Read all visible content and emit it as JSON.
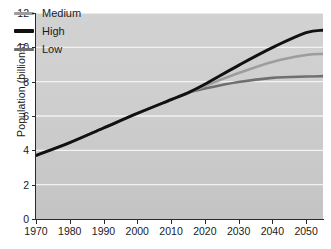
{
  "chart_data": {
    "type": "line",
    "title": "",
    "xlabel": "",
    "ylabel": "Population (billions)",
    "xlim": [
      1970,
      2055
    ],
    "ylim": [
      0,
      12
    ],
    "xticks": [
      1970,
      1980,
      1990,
      2000,
      2010,
      2020,
      2030,
      2040,
      2050
    ],
    "yticks": [
      0,
      2,
      4,
      6,
      8,
      10,
      12
    ],
    "grid": "horizontal-white",
    "legend_position": "top-left-inside",
    "x": [
      1970,
      1980,
      1990,
      2000,
      2010,
      2015,
      2020,
      2030,
      2040,
      2050,
      2055
    ],
    "series": [
      {
        "name": "Medium",
        "color": "#9d9d9d",
        "values": [
          3.7,
          4.45,
          5.3,
          6.15,
          6.95,
          7.35,
          7.75,
          8.5,
          9.15,
          9.55,
          9.62
        ]
      },
      {
        "name": "High",
        "color": "#111111",
        "values": [
          3.7,
          4.45,
          5.3,
          6.15,
          6.95,
          7.35,
          7.85,
          8.95,
          9.98,
          10.85,
          11.0
        ]
      },
      {
        "name": "Low",
        "color": "#6f6f6f",
        "values": [
          3.7,
          4.45,
          5.3,
          6.15,
          6.95,
          7.35,
          7.6,
          7.98,
          8.22,
          8.3,
          8.32
        ]
      }
    ]
  },
  "legend": {
    "items": [
      {
        "label": "Medium",
        "color": "#9d9d9d",
        "weight": "thin"
      },
      {
        "label": "High",
        "color": "#111111",
        "weight": "thick"
      },
      {
        "label": "Low",
        "color": "#6f6f6f",
        "weight": "thin"
      }
    ]
  },
  "axes": {
    "y_title": "Population (billions)",
    "y_tick_labels": [
      "12",
      "10",
      "8",
      "6",
      "4",
      "2",
      "0"
    ],
    "x_tick_labels": [
      "1970",
      "1980",
      "1990",
      "2000",
      "2010",
      "2020",
      "2030",
      "2040",
      "2050"
    ]
  },
  "colors": {
    "plot_background": "#cfcfcf",
    "gridline": "#f2f2f2",
    "axis": "#2a2a2a",
    "text": "#1a1a1a",
    "page_background": "#ffffff"
  }
}
